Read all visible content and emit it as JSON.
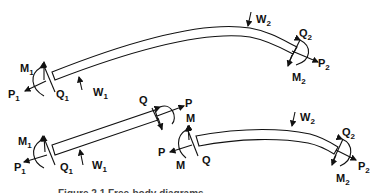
{
  "figure": {
    "caption": "Figure 2.1 Free-body diagrams",
    "colors": {
      "ink": "#111111",
      "background": "#ffffff"
    },
    "top_beam": {
      "left_end": {
        "moment": "M",
        "moment_sub": "1",
        "axial": "P",
        "axial_sub": "1",
        "shear": "Q",
        "shear_sub": "1"
      },
      "distributed_load_left": {
        "label": "W",
        "sub": "1"
      },
      "distributed_load_right": {
        "label": "W",
        "sub": "2"
      },
      "right_end": {
        "shear": "Q",
        "shear_sub": "2",
        "axial": "P",
        "axial_sub": "2",
        "moment": "M",
        "moment_sub": "2"
      }
    },
    "bottom_left_segment": {
      "left_end": {
        "moment": "M",
        "moment_sub": "1",
        "axial": "P",
        "axial_sub": "1",
        "shear": "Q",
        "shear_sub": "1"
      },
      "load": {
        "label": "W",
        "sub": "1"
      },
      "cut_end": {
        "shear": "Q",
        "axial": "P",
        "moment": "M"
      }
    },
    "bottom_right_segment": {
      "cut_end": {
        "moment": "M",
        "axial": "P",
        "moment2": "M",
        "shear": "Q"
      },
      "load": {
        "label": "W",
        "sub": "2"
      },
      "right_end": {
        "shear": "Q",
        "shear_sub": "2",
        "axial": "P",
        "axial_sub": "2",
        "moment": "M",
        "moment_sub": "2"
      }
    }
  }
}
